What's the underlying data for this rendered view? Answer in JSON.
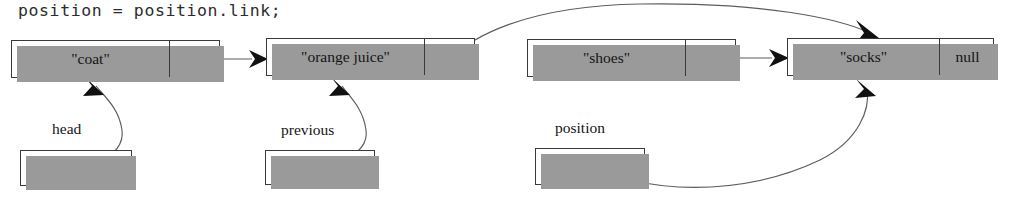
{
  "figure": {
    "kind": "linked-list-pointer-diagram",
    "code_line": "position = position.link;",
    "null_label": "null"
  },
  "nodes": [
    {
      "id": "node-coat",
      "data": "\"coat\"",
      "link": "",
      "x": 11,
      "y": 40,
      "w": 209,
      "h": 38,
      "split": 157
    },
    {
      "id": "node-orange-juice",
      "data": "\"orange juice\"",
      "link": "",
      "x": 266,
      "y": 38,
      "w": 209,
      "h": 38,
      "split": 157
    },
    {
      "id": "node-shoes",
      "data": "\"shoes\"",
      "link": "",
      "x": 527,
      "y": 39,
      "w": 209,
      "h": 38,
      "split": 157
    },
    {
      "id": "node-socks",
      "data": "\"socks\"",
      "link": "null",
      "x": 787,
      "y": 38,
      "w": 207,
      "h": 38,
      "split": 151
    }
  ],
  "variables": [
    {
      "id": "var-head",
      "label": "head",
      "label_x": 52,
      "label_y": 120,
      "x": 20,
      "y": 150,
      "w": 112,
      "h": 36
    },
    {
      "id": "var-previous",
      "label": "previous",
      "label_x": 281,
      "label_y": 121,
      "x": 265,
      "y": 150,
      "w": 110,
      "h": 35
    },
    {
      "id": "var-position",
      "label": "position",
      "label_x": 555,
      "label_y": 119,
      "x": 535,
      "y": 148,
      "w": 110,
      "h": 37
    }
  ],
  "pointers": [
    {
      "id": "link-coat-to-orange-juice",
      "from": "node-coat",
      "to": "node-orange-juice",
      "style": "straight"
    },
    {
      "id": "link-orange-juice-to-socks",
      "from": "node-orange-juice",
      "to": "node-socks",
      "style": "long-arc-over"
    },
    {
      "id": "link-shoes-to-socks",
      "from": "node-shoes",
      "to": "node-socks",
      "style": "straight"
    },
    {
      "id": "ref-head-to-coat",
      "from": "var-head",
      "to": "node-coat",
      "style": "curve-up"
    },
    {
      "id": "ref-previous-to-orange-juice",
      "from": "var-previous",
      "to": "node-orange-juice",
      "style": "curve-up"
    },
    {
      "id": "ref-position-to-socks",
      "from": "var-position",
      "to": "node-socks",
      "style": "long-sweep-up"
    }
  ]
}
